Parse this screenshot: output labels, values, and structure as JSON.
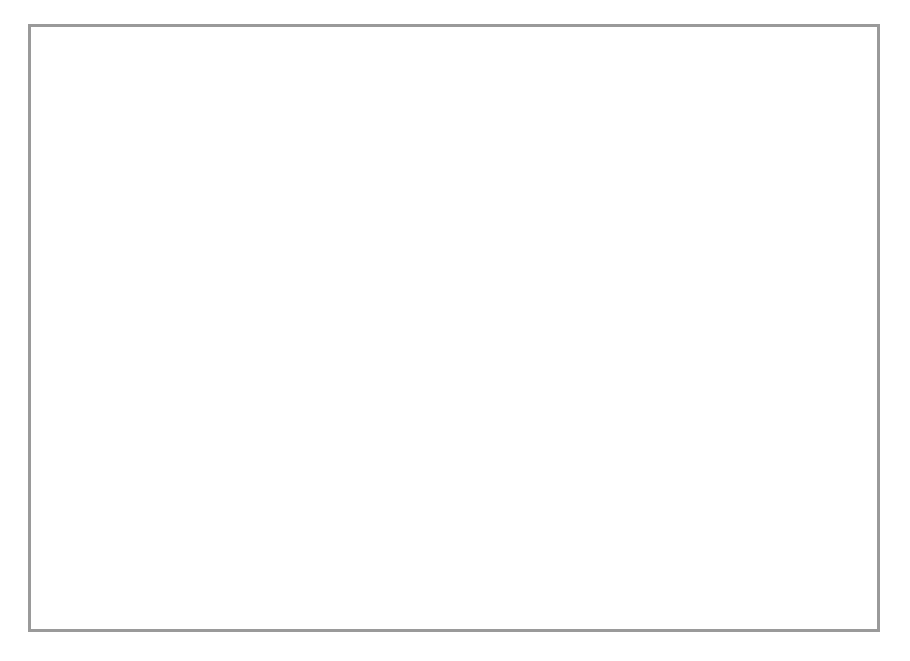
{
  "chart_data": {
    "type": "line",
    "title": "",
    "xlabel": "Month",
    "ylabel": "Price ($ per tonne)",
    "categories": [
      "January",
      "February",
      "March",
      "April",
      "May",
      "June",
      "July",
      "August",
      "September",
      "October",
      "November",
      "December"
    ],
    "ylim": [
      40,
      100
    ],
    "y_ticks": [
      40,
      50,
      60,
      70,
      80,
      90,
      100
    ],
    "y_axis_break": true,
    "grid": "horizontal-dotted",
    "legend_position": "inside-bottom-center",
    "series": [
      {
        "name": "2006",
        "marker": "diamond",
        "values": [
          60.0,
          62.0,
          63.0,
          67.0,
          71.2,
          69.2,
          65.2,
          64.2,
          62.3,
          58.3,
          52.3,
          54.2
        ]
      },
      {
        "name": "2007",
        "marker": "square",
        "values": [
          68.3,
          67.3,
          68.0,
          69.0,
          73.2,
          75.2,
          71.2,
          67.3,
          67.3,
          63.3,
          61.3,
          59.3
        ]
      },
      {
        "name": "2008",
        "marker": "triangle",
        "values": [
          66.0,
          67.3,
          73.0,
          77.3,
          80.0,
          84.2,
          84.0,
          75.2,
          72.3,
          67.3,
          63.3,
          61.3
        ]
      },
      {
        "name": "2009",
        "marker": "crossed-square",
        "values": [
          68.7,
          70.0,
          76.2,
          77.3,
          84.2,
          85.0,
          87.2,
          80.2,
          79.2,
          75.3,
          72.3,
          72.3
        ]
      },
      {
        "name": "2010",
        "marker": "star",
        "values": [
          71.0,
          76.0,
          78.0,
          80.0,
          85.0,
          90.0,
          92.0,
          88.0,
          87.2,
          84.2,
          79.2,
          76.3
        ]
      }
    ]
  },
  "axis": {
    "y_title": "Price ($ per tonne)",
    "x_title": "Month"
  },
  "colors": {
    "line": "#666666",
    "marker_stroke": "#1a1a1a",
    "marker_fill": "#ffffff",
    "grid": "#9c9c9c",
    "axis": "#6e6e6e",
    "frame": "#9a9a9a",
    "background": "#ffffff"
  }
}
